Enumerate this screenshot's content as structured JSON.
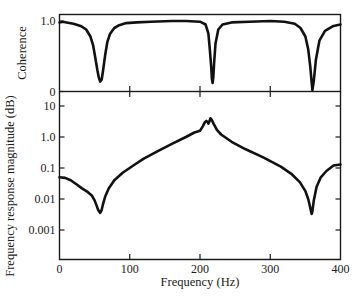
{
  "chart_data": [
    {
      "id": "coherence",
      "type": "line",
      "title": "",
      "xlabel": "",
      "ylabel": "Coherence",
      "xlim": [
        0,
        400
      ],
      "ylim": [
        0,
        1.08
      ],
      "yticks": [
        {
          "value": 0,
          "label": "0"
        },
        {
          "value": 1.0,
          "label": "1.0"
        }
      ],
      "xticks": [
        100,
        200,
        300
      ],
      "grid": false,
      "series": [
        {
          "name": "Coherence",
          "x": [
            0,
            5,
            10,
            20,
            30,
            38,
            44,
            48,
            51,
            54,
            56,
            58,
            60,
            62,
            65,
            68,
            72,
            78,
            85,
            95,
            110,
            130,
            160,
            180,
            200,
            208,
            212,
            214,
            216,
            217,
            218,
            219,
            220,
            222,
            226,
            232,
            245,
            270,
            300,
            320,
            335,
            343,
            350,
            354,
            357,
            359,
            360,
            362,
            365,
            370,
            378,
            390,
            400
          ],
          "y": [
            0.98,
            0.99,
            0.98,
            0.96,
            0.93,
            0.88,
            0.78,
            0.65,
            0.48,
            0.3,
            0.2,
            0.14,
            0.17,
            0.3,
            0.52,
            0.7,
            0.82,
            0.9,
            0.94,
            0.97,
            0.98,
            0.99,
            1.0,
            1.0,
            0.99,
            0.95,
            0.82,
            0.6,
            0.35,
            0.18,
            0.12,
            0.2,
            0.4,
            0.68,
            0.88,
            0.95,
            0.98,
            0.99,
            1.0,
            0.99,
            0.96,
            0.9,
            0.78,
            0.6,
            0.35,
            0.12,
            0.02,
            0.15,
            0.45,
            0.72,
            0.86,
            0.93,
            0.95
          ]
        }
      ]
    },
    {
      "id": "frequency-response",
      "type": "line",
      "title": "",
      "xlabel": "Frequency (Hz)",
      "ylabel": "Frequency response magnitude (dB)",
      "xlim": [
        0,
        400
      ],
      "ylim": [
        0.00012,
        30
      ],
      "yscale": "log",
      "yticks": [
        {
          "value": 10,
          "label": "10"
        },
        {
          "value": 1,
          "label": "1.0"
        },
        {
          "value": 0.1,
          "label": "0.1"
        },
        {
          "value": 0.01,
          "label": "0.01"
        },
        {
          "value": 0.001,
          "label": "0.001"
        }
      ],
      "xticks": [
        {
          "value": 0,
          "label": "0"
        },
        {
          "value": 100,
          "label": "100"
        },
        {
          "value": 200,
          "label": "200"
        },
        {
          "value": 300,
          "label": "300"
        },
        {
          "value": 400,
          "label": "400"
        }
      ],
      "grid": false,
      "series": [
        {
          "name": "Frequency response magnitude",
          "x": [
            0,
            8,
            16,
            24,
            32,
            40,
            46,
            50,
            53,
            55,
            57,
            58,
            60,
            62,
            65,
            70,
            78,
            90,
            105,
            120,
            140,
            160,
            180,
            192,
            200,
            204,
            207,
            209,
            211,
            212,
            213,
            215,
            217,
            220,
            224,
            230,
            245,
            265,
            290,
            315,
            330,
            342,
            350,
            354,
            356,
            358,
            359,
            360,
            362,
            366,
            372,
            380,
            390,
            400
          ],
          "y": [
            0.05,
            0.048,
            0.04,
            0.03,
            0.022,
            0.017,
            0.013,
            0.009,
            0.006,
            0.0045,
            0.0038,
            0.0036,
            0.0045,
            0.007,
            0.012,
            0.022,
            0.04,
            0.07,
            0.12,
            0.2,
            0.35,
            0.6,
            1.0,
            1.4,
            1.6,
            2.2,
            3.0,
            3.3,
            3.0,
            2.7,
            3.0,
            4.0,
            3.5,
            2.5,
            1.7,
            1.2,
            0.7,
            0.4,
            0.22,
            0.11,
            0.065,
            0.035,
            0.018,
            0.01,
            0.0065,
            0.004,
            0.0033,
            0.004,
            0.009,
            0.025,
            0.05,
            0.08,
            0.12,
            0.13
          ]
        }
      ]
    }
  ]
}
